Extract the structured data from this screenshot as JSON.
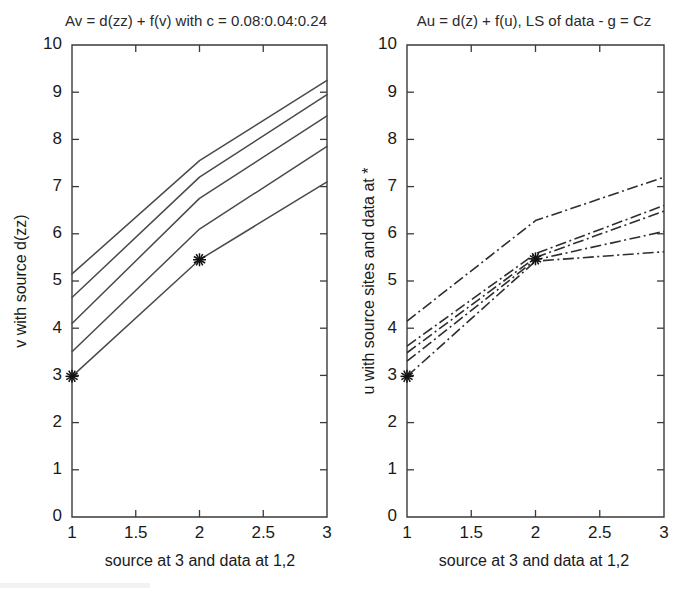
{
  "figure": {
    "width": 684,
    "height": 594,
    "background": "#ffffff",
    "ink_color": "#3a3a3a"
  },
  "chart_data": [
    {
      "panel": "left",
      "type": "line",
      "title": "Av = d(zz) + f(v) with c = 0.08:0.04:0.24",
      "xlabel": "source at 3 and data at 1,2",
      "ylabel": "v with source d(zz)",
      "xlim": [
        1,
        3
      ],
      "ylim": [
        0,
        10
      ],
      "xticks": [
        1,
        1.5,
        2,
        2.5,
        3
      ],
      "xticklabels": [
        "1",
        "1.5",
        "2",
        "2.5",
        "3"
      ],
      "yticks": [
        0,
        1,
        2,
        3,
        4,
        5,
        6,
        7,
        8,
        9,
        10
      ],
      "yticklabels": [
        "0",
        "1",
        "2",
        "3",
        "4",
        "5",
        "6",
        "7",
        "8",
        "9",
        "10"
      ],
      "grid": false,
      "legend": "none",
      "linestyle": "solid",
      "x": [
        1,
        2,
        3
      ],
      "series": [
        {
          "name": "c = 0.24",
          "values": [
            5.15,
            7.55,
            9.25
          ]
        },
        {
          "name": "c = 0.20",
          "values": [
            4.65,
            7.2,
            8.95
          ]
        },
        {
          "name": "c = 0.16",
          "values": [
            4.1,
            6.75,
            8.5
          ]
        },
        {
          "name": "c = 0.12",
          "values": [
            3.5,
            6.1,
            7.85
          ]
        },
        {
          "name": "c = 0.08",
          "values": [
            2.98,
            5.45,
            7.1
          ]
        }
      ],
      "markers": [
        {
          "label": "data at 1",
          "x": 1,
          "y": 2.98,
          "symbol": "*"
        },
        {
          "label": "data at 2",
          "x": 2,
          "y": 5.45,
          "symbol": "*"
        }
      ]
    },
    {
      "panel": "right",
      "type": "line",
      "title": "Au = d(z) + f(u), LS of data - g = Cz",
      "xlabel": "source at 3 and data at 1,2",
      "ylabel": "u with source sites and data at *",
      "xlim": [
        1,
        3
      ],
      "ylim": [
        0,
        10
      ],
      "xticks": [
        1,
        1.5,
        2,
        2.5,
        3
      ],
      "xticklabels": [
        "1",
        "1.5",
        "2",
        "2.5",
        "3"
      ],
      "yticks": [
        0,
        1,
        2,
        3,
        4,
        5,
        6,
        7,
        8,
        9,
        10
      ],
      "yticklabels": [
        "0",
        "1",
        "2",
        "3",
        "4",
        "5",
        "6",
        "7",
        "8",
        "9",
        "10"
      ],
      "grid": false,
      "legend": "none",
      "linestyle": "dashdot",
      "x": [
        1,
        2,
        3
      ],
      "series": [
        {
          "name": "LS fit 1",
          "values": [
            4.15,
            6.28,
            7.2
          ]
        },
        {
          "name": "LS fit 2",
          "values": [
            3.62,
            5.58,
            6.6
          ]
        },
        {
          "name": "LS fit 3",
          "values": [
            3.48,
            5.5,
            6.48
          ]
        },
        {
          "name": "LS fit 4",
          "values": [
            3.3,
            5.45,
            6.05
          ]
        },
        {
          "name": "LS fit 5",
          "values": [
            2.98,
            5.42,
            5.62
          ]
        }
      ],
      "markers": [
        {
          "label": "data at 1",
          "x": 1,
          "y": 2.98,
          "symbol": "*"
        },
        {
          "label": "data at 2",
          "x": 2,
          "y": 5.47,
          "symbol": "*"
        }
      ]
    }
  ]
}
